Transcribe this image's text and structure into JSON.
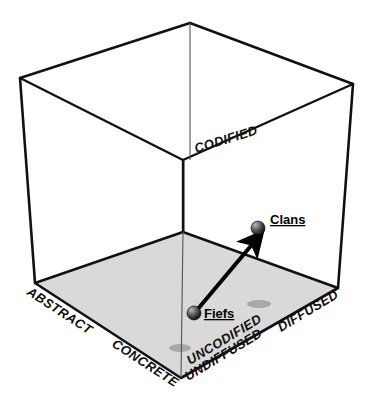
{
  "figure": {
    "background_color": "#ffffff",
    "line_color": "#111111",
    "floor_color": "#d9d9d9",
    "shadow_color": "#a8a8a8"
  },
  "axes": [
    {
      "key": "codified",
      "label": "CODIFIED",
      "x": 196,
      "y": 153,
      "rotate": -17
    },
    {
      "key": "uncodified",
      "label": "UNCODIFIED",
      "x": 190,
      "y": 365,
      "rotate": -31
    },
    {
      "key": "abstract",
      "label": "ABSTRACT",
      "x": 26,
      "y": 294,
      "rotate": 33
    },
    {
      "key": "concrete",
      "label": "CONCRETE",
      "x": 111,
      "y": 346,
      "rotate": 33
    },
    {
      "key": "diffused",
      "label": "DIFFUSED",
      "x": 281,
      "y": 332,
      "rotate": -31
    },
    {
      "key": "undiffused",
      "label": "UNDIFFUSED",
      "x": 188,
      "y": 381,
      "rotate": -31
    }
  ],
  "points": [
    {
      "key": "clans",
      "label": "Clans",
      "marker_x": 258,
      "marker_y": 228,
      "marker_r": 7,
      "label_x": 270,
      "label_y": 224
    },
    {
      "key": "fiefs",
      "label": "Fiefs",
      "marker_x": 194,
      "marker_y": 313,
      "marker_r": 7,
      "label_x": 204,
      "label_y": 318
    }
  ],
  "arrow": {
    "key": "fiefs-to-clans",
    "from_x": 197,
    "from_y": 310,
    "to_x": 255,
    "to_y": 241,
    "width": 4
  },
  "shadows": [
    {
      "key": "clans-shadow",
      "cx": 259,
      "cy": 304,
      "rx": 12,
      "ry": 4
    },
    {
      "key": "fiefs-shadow",
      "cx": 180,
      "cy": 348,
      "rx": 11,
      "ry": 4
    }
  ],
  "cube": {
    "top_back": {
      "x": 190,
      "y": 23
    },
    "top_left": {
      "x": 20,
      "y": 78
    },
    "top_right": {
      "x": 353,
      "y": 84
    },
    "top_front": {
      "x": 183,
      "y": 160
    },
    "bot_back": {
      "x": 183,
      "y": 232
    },
    "bot_left": {
      "x": 35,
      "y": 283
    },
    "bot_right": {
      "x": 338,
      "y": 288
    },
    "bot_front": {
      "x": 181,
      "y": 378
    }
  }
}
